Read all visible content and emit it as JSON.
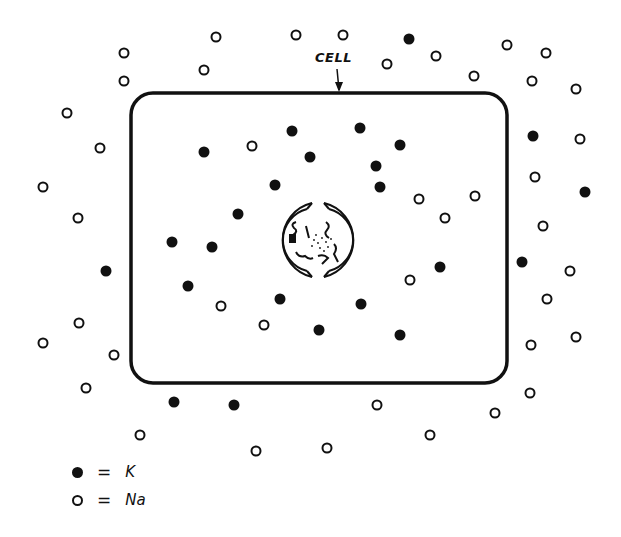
{
  "diagram": {
    "cell_label": "CELL",
    "colors": {
      "ink": "#111111",
      "background": "#ffffff"
    },
    "cell_box": {
      "x": 131,
      "y": 93,
      "width": 376,
      "height": 290,
      "radius": 22
    },
    "nucleus": {
      "cx": 318,
      "cy": 240,
      "r": 38
    },
    "legend": [
      {
        "symbol": "filled-circle",
        "equals": "=",
        "label": "K"
      },
      {
        "symbol": "open-circle",
        "equals": "=",
        "label": "Na"
      }
    ],
    "ions_inside": {
      "K": [
        [
          204,
          152
        ],
        [
          292,
          131
        ],
        [
          360,
          128
        ],
        [
          310,
          157
        ],
        [
          400,
          145
        ],
        [
          376,
          166
        ],
        [
          380,
          187
        ],
        [
          275,
          185
        ],
        [
          238,
          214
        ],
        [
          172,
          242
        ],
        [
          212,
          247
        ],
        [
          188,
          286
        ],
        [
          280,
          299
        ],
        [
          361,
          304
        ],
        [
          319,
          330
        ],
        [
          400,
          335
        ],
        [
          440,
          267
        ]
      ],
      "Na": [
        [
          252,
          146
        ],
        [
          419,
          199
        ],
        [
          475,
          196
        ],
        [
          445,
          218
        ],
        [
          410,
          280
        ],
        [
          221,
          306
        ],
        [
          264,
          325
        ]
      ]
    },
    "ions_outside": {
      "K": [
        [
          409,
          39
        ],
        [
          533,
          136
        ],
        [
          585,
          192
        ],
        [
          522,
          262
        ],
        [
          106,
          271
        ],
        [
          174,
          402
        ],
        [
          234,
          405
        ]
      ],
      "Na": [
        [
          124,
          53
        ],
        [
          124,
          81
        ],
        [
          216,
          37
        ],
        [
          204,
          70
        ],
        [
          296,
          35
        ],
        [
          343,
          35
        ],
        [
          387,
          64
        ],
        [
          436,
          56
        ],
        [
          507,
          45
        ],
        [
          546,
          53
        ],
        [
          474,
          76
        ],
        [
          532,
          81
        ],
        [
          576,
          89
        ],
        [
          67,
          113
        ],
        [
          100,
          148
        ],
        [
          43,
          187
        ],
        [
          78,
          218
        ],
        [
          580,
          139
        ],
        [
          535,
          177
        ],
        [
          543,
          226
        ],
        [
          570,
          271
        ],
        [
          547,
          299
        ],
        [
          576,
          337
        ],
        [
          531,
          345
        ],
        [
          79,
          323
        ],
        [
          43,
          343
        ],
        [
          114,
          355
        ],
        [
          86,
          388
        ],
        [
          530,
          393
        ],
        [
          495,
          413
        ],
        [
          377,
          405
        ],
        [
          140,
          435
        ],
        [
          256,
          451
        ],
        [
          327,
          448
        ],
        [
          430,
          435
        ]
      ]
    }
  }
}
